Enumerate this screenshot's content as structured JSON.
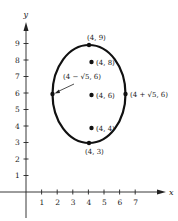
{
  "figure": {
    "axes": {
      "x_label": "x",
      "y_label": "y",
      "x_ticks": [
        "1",
        "2",
        "3",
        "4",
        "5",
        "6",
        "7"
      ],
      "y_ticks": [
        "1",
        "2",
        "3",
        "4",
        "5",
        "6",
        "7",
        "8",
        "9"
      ]
    },
    "ellipse": {
      "center": [
        4,
        6
      ],
      "semi_axis_x": 2.236,
      "semi_axis_y": 3,
      "stroke_color": "#111111"
    },
    "points": [
      {
        "id": "top-vertex",
        "label": "(4, 9)",
        "x": 4,
        "y": 9
      },
      {
        "id": "focus-upper",
        "label": "(4, 8)",
        "x": 4,
        "y": 8
      },
      {
        "id": "center",
        "label": "(4, 6)",
        "x": 4,
        "y": 6
      },
      {
        "id": "focus-lower",
        "label": "(4, 4)",
        "x": 4,
        "y": 4
      },
      {
        "id": "bottom-vertex",
        "label": "(4, 3)",
        "x": 4,
        "y": 3
      },
      {
        "id": "left-covertex",
        "label": "(4 − √5, 6)",
        "x": 1.764,
        "y": 6
      },
      {
        "id": "right-covertex",
        "label": "(4 + √5, 6)",
        "x": 6.236,
        "y": 6
      }
    ]
  }
}
